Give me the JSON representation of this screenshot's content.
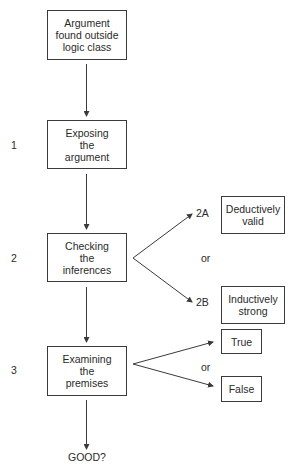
{
  "diagram": {
    "type": "flowchart",
    "colors": {
      "line": "#3a3a3a",
      "text": "#2a2a2a",
      "background": "#ffffff"
    },
    "main_steps": [
      {
        "id": "start",
        "text": "Argument\nfound outside\nlogic class",
        "step_number": ""
      },
      {
        "id": "expose",
        "text": "Exposing\nthe\nargument",
        "step_number": "1"
      },
      {
        "id": "check",
        "text": "Checking\nthe\ninferences",
        "step_number": "2"
      },
      {
        "id": "examine",
        "text": "Examining\nthe\npremises",
        "step_number": "3"
      }
    ],
    "inference_branches": [
      {
        "id": "2A",
        "label": "2A",
        "text": "Deductively\nvalid"
      },
      {
        "id": "2B",
        "label": "2B",
        "text": "Inductively\nstrong"
      }
    ],
    "premise_branches": [
      {
        "id": "true",
        "text": "True"
      },
      {
        "id": "false",
        "text": "False"
      }
    ],
    "separator_or": "or",
    "outcome": "GOOD?"
  }
}
